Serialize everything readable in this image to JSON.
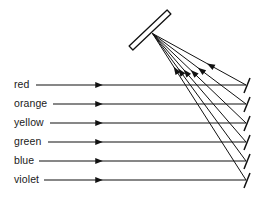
{
  "figure": {
    "type": "optics-ray-diagram",
    "background_color": "#ffffff",
    "line_color": "#111111",
    "text_color": "#1a1a1a",
    "width": 267,
    "height": 197
  },
  "grating": {
    "name": "diffraction-grating",
    "label": "",
    "start": {
      "x": 131,
      "y": 48
    },
    "end": {
      "x": 169,
      "y": 12
    },
    "thickness": 5.5,
    "fill": "#ffffff",
    "stroke": "#111111"
  },
  "convergence_point": {
    "x": 152.5,
    "y": 33.5,
    "name": "grating-interaction-point"
  },
  "rays": [
    {
      "label": "red",
      "label_x": 14,
      "label_y": 85,
      "line_start_x": 36,
      "line_end_x": 246,
      "y": 85,
      "arrow_x": 99,
      "endpoint": {
        "x": 246,
        "y": 85
      },
      "diffracted_arrow_t": 0.62
    },
    {
      "label": "orange",
      "label_x": 14,
      "label_y": 104,
      "line_start_x": 53,
      "line_end_x": 246,
      "y": 104,
      "arrow_x": 99,
      "endpoint": {
        "x": 246,
        "y": 104
      },
      "diffracted_arrow_t": 0.52
    },
    {
      "label": "yellow",
      "label_x": 14,
      "label_y": 123,
      "line_start_x": 50,
      "line_end_x": 246,
      "y": 123,
      "arrow_x": 99,
      "endpoint": {
        "x": 246,
        "y": 123
      },
      "diffracted_arrow_t": 0.44
    },
    {
      "label": "green",
      "label_x": 14,
      "label_y": 142,
      "line_start_x": 48,
      "line_end_x": 246,
      "y": 142,
      "arrow_x": 99,
      "endpoint": {
        "x": 246,
        "y": 142
      },
      "diffracted_arrow_t": 0.36
    },
    {
      "label": "blue",
      "label_x": 14,
      "label_y": 161,
      "line_start_x": 39,
      "line_end_x": 246,
      "y": 161,
      "arrow_x": 99,
      "endpoint": {
        "x": 246,
        "y": 161
      },
      "diffracted_arrow_t": 0.3
    },
    {
      "label": "violet",
      "label_x": 14,
      "label_y": 180,
      "line_start_x": 44,
      "line_end_x": 246,
      "y": 180,
      "arrow_x": 99,
      "endpoint": {
        "x": 246,
        "y": 180
      },
      "diffracted_arrow_t": 0.25
    }
  ],
  "endpoint_tick": {
    "name": "screen-tick-mark",
    "dx1": 4,
    "dy1": -7,
    "dx2": -2,
    "dy2": 8
  }
}
